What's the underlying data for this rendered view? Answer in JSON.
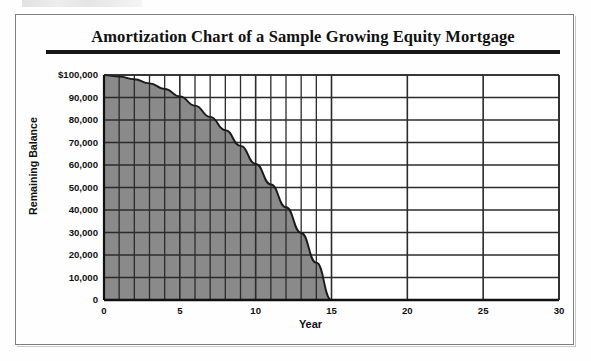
{
  "figure": {
    "title": "Amortization Chart of a Sample Growing Equity Mortgage",
    "x_axis_title": "Year",
    "y_axis_title": "Remaining Balance"
  },
  "chart_data": {
    "type": "area",
    "title": "Amortization Chart of a Sample Growing Equity Mortgage",
    "xlabel": "Year",
    "ylabel": "Remaining Balance",
    "xlim": [
      0,
      30
    ],
    "ylim": [
      0,
      100000
    ],
    "xticks": [
      0,
      5,
      10,
      15,
      20,
      25,
      30
    ],
    "xtick_labels": [
      "0",
      "5",
      "10",
      "15",
      "20",
      "25",
      "30"
    ],
    "yticks": [
      0,
      10000,
      20000,
      30000,
      40000,
      50000,
      60000,
      70000,
      80000,
      90000,
      100000
    ],
    "ytick_labels": [
      "0",
      "10,000",
      "20,000",
      "30,000",
      "40,000",
      "50,000",
      "60,000",
      "70,000",
      "80,000",
      "90,000",
      "$100,000"
    ],
    "grid": true,
    "grid_minor_x_range": [
      0,
      15
    ],
    "grid_minor_x_step": 1,
    "legend": null,
    "fill_color": "#8a8a8a",
    "line_color": "#1a1a1a",
    "grid_color": "#2b2b2b",
    "series": [
      {
        "name": "Remaining Balance",
        "x": [
          0,
          1,
          2,
          3,
          4,
          5,
          6,
          7,
          8,
          9,
          10,
          11,
          12,
          13,
          14,
          15
        ],
        "values": [
          100000,
          99300,
          98100,
          96300,
          93800,
          90500,
          86400,
          81400,
          75500,
          68500,
          60500,
          51400,
          41200,
          29800,
          16600,
          0
        ]
      }
    ],
    "annotations": [
      "Balance reaches zero at year 15",
      "Shaded area spans years 0 to 15"
    ]
  }
}
